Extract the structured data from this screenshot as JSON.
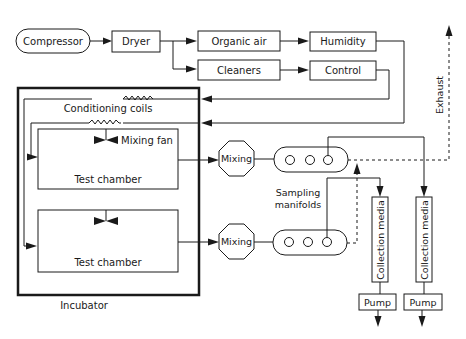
{
  "diagram": {
    "nodes": {
      "compressor": "Compressor",
      "dryer": "Dryer",
      "organic_air": "Organic air",
      "cleaners": "Cleaners",
      "humidity": "Humidity",
      "control": "Control",
      "conditioning_coils": "Conditioning coils",
      "mixing_fan": "Mixing fan",
      "test_chamber_1": "Test chamber",
      "test_chamber_2": "Test chamber",
      "incubator": "Incubator",
      "mixing_1": "Mixing",
      "mixing_2": "Mixing",
      "sampling_manifolds_line1": "Sampling",
      "sampling_manifolds_line2": "manifolds",
      "collection_media_1": "Collection media",
      "collection_media_2": "Collection media",
      "pump_1": "Pump",
      "pump_2": "Pump",
      "exhaust": "Exhaust"
    },
    "edges": [
      {
        "from": "Compressor",
        "to": "Dryer"
      },
      {
        "from": "Dryer",
        "to": "Organic air"
      },
      {
        "from": "Dryer",
        "to": "Cleaners"
      },
      {
        "from": "Organic air",
        "to": "Humidity"
      },
      {
        "from": "Cleaners",
        "to": "Control"
      },
      {
        "from": "Control",
        "to": "Conditioning coils (upper)"
      },
      {
        "from": "Humidity",
        "to": "Conditioning coils (lower)"
      },
      {
        "from": "Conditioning coils",
        "to": "Test chamber (upper)"
      },
      {
        "from": "Conditioning coils",
        "to": "Test chamber (lower)"
      },
      {
        "from": "Test chamber (upper)",
        "to": "Mixing (upper)"
      },
      {
        "from": "Test chamber (lower)",
        "to": "Mixing (lower)"
      },
      {
        "from": "Mixing (upper)",
        "to": "Sampling manifold (upper)"
      },
      {
        "from": "Mixing (lower)",
        "to": "Sampling manifold (lower)"
      },
      {
        "from": "Sampling manifold (upper)",
        "to": "Collection media (right)"
      },
      {
        "from": "Sampling manifold (lower)",
        "to": "Collection media (left)"
      },
      {
        "from": "Collection media",
        "to": "Pump"
      },
      {
        "from": "Sampling manifolds",
        "to": "Exhaust",
        "style": "dashed"
      }
    ],
    "colors": {
      "line": "#1a1a1a",
      "background": "#ffffff"
    }
  }
}
